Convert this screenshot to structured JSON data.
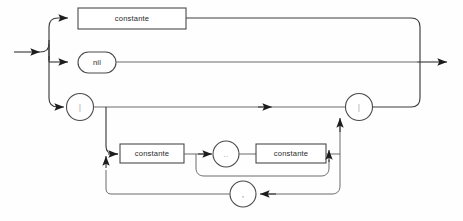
{
  "diagram": {
    "kind": "railroad-syntax-diagram",
    "background_color": "#fefefe",
    "line_color": "#3c3c3c",
    "text_color": "#2a2a2a",
    "width": 463,
    "height": 221
  },
  "nodes": {
    "constante_top": {
      "label": "constante",
      "shape": "box"
    },
    "nil": {
      "label": "nil",
      "shape": "oval"
    },
    "bracket_open": {
      "label": "|",
      "shape": "circle"
    },
    "bracket_close": {
      "label": "|",
      "shape": "circle"
    },
    "constante_lower_left": {
      "label": "constante",
      "shape": "box"
    },
    "range_dots": {
      "label": "..",
      "shape": "circle"
    },
    "constante_lower_right": {
      "label": "constante",
      "shape": "box"
    },
    "comma": {
      "label": ",",
      "shape": "circle"
    }
  },
  "paths": {
    "entry_label": "entry",
    "exit_label": "exit",
    "branch_constante": "alternative-constante",
    "branch_nil": "alternative-nil",
    "branch_set": "alternative-set-constructor",
    "loop_comma": "repeat-via-comma",
    "bypass_range": "skip-subrange",
    "bypass_set_body": "skip-set-elements"
  }
}
